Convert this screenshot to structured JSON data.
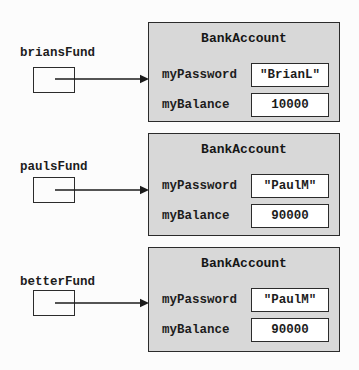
{
  "diagram": {
    "sections": [
      {
        "ref_label": "briansFund",
        "class_name": "BankAccount",
        "fields": [
          {
            "name": "myPassword",
            "value": "\"BrianL\""
          },
          {
            "name": "myBalance",
            "value": "10000"
          }
        ]
      },
      {
        "ref_label": "paulsFund",
        "class_name": "BankAccount",
        "fields": [
          {
            "name": "myPassword",
            "value": "\"PaulM\""
          },
          {
            "name": "myBalance",
            "value": "90000"
          }
        ]
      },
      {
        "ref_label": "betterFund",
        "class_name": "BankAccount",
        "fields": [
          {
            "name": "myPassword",
            "value": "\"PaulM\""
          },
          {
            "name": "myBalance",
            "value": "90000"
          }
        ]
      }
    ],
    "colors": {
      "object_fill": "#d8d8d8",
      "value_fill": "#ffffff",
      "border": "#2b2b2b"
    }
  }
}
